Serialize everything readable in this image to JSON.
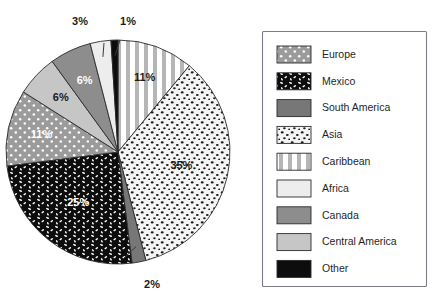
{
  "chart_data": {
    "type": "pie",
    "title": "",
    "subtitle": "",
    "xlabel": "",
    "ylabel": "",
    "legend_position": "right",
    "grid": false,
    "categories": [
      "Caribbean",
      "Asia",
      "South America",
      "Mexico",
      "Europe",
      "Central America",
      "Canada",
      "Africa",
      "Other"
    ],
    "values": [
      11,
      35,
      2,
      25,
      11,
      6,
      6,
      3,
      1
    ],
    "value_labels": [
      "11%",
      "35%",
      "2%",
      "25%",
      "11%",
      "6%",
      "6%",
      "3%",
      "1%"
    ],
    "slices": [
      {
        "name": "Caribbean",
        "value": 11,
        "label": "11%",
        "fill": "#ffffff",
        "pattern": "vertical-stripes",
        "label_placement": "inside",
        "label_fill": "#1b1b1b"
      },
      {
        "name": "Asia",
        "value": 35,
        "label": "35%",
        "fill": "#f2f2f2",
        "pattern": "black-speckles",
        "label_placement": "inside",
        "label_fill": "#1b1b1b"
      },
      {
        "name": "South America",
        "value": 2,
        "label": "2%",
        "fill": "#777777",
        "pattern": "solid",
        "label_placement": "callout",
        "label_fill": "#1b1b1b"
      },
      {
        "name": "Mexico",
        "value": 25,
        "label": "25%",
        "fill": "#0d0d0d",
        "pattern": "white-dashes",
        "label_placement": "inside",
        "label_fill": "#ffffff"
      },
      {
        "name": "Europe",
        "value": 11,
        "label": "11%",
        "fill": "#9b9b9b",
        "pattern": "white-dots",
        "label_placement": "inside",
        "label_fill": "#ffffff"
      },
      {
        "name": "Central America",
        "value": 6,
        "label": "6%",
        "fill": "#c6c6c6",
        "pattern": "solid",
        "label_placement": "inside",
        "label_fill": "#1b1b1b"
      },
      {
        "name": "Canada",
        "value": 6,
        "label": "6%",
        "fill": "#8d8d8d",
        "pattern": "solid",
        "label_placement": "inside",
        "label_fill": "#ffffff"
      },
      {
        "name": "Africa",
        "value": 3,
        "label": "3%",
        "fill": "#ededed",
        "pattern": "solid",
        "label_placement": "callout",
        "label_fill": "#1b1b1b"
      },
      {
        "name": "Other",
        "value": 1,
        "label": "1%",
        "fill": "#0d0d0d",
        "pattern": "solid",
        "label_placement": "callout",
        "label_fill": "#1b1b1b"
      }
    ]
  },
  "legend": {
    "items": [
      {
        "label": "Europe",
        "fill": "#9b9b9b",
        "pattern": "white-dots"
      },
      {
        "label": "Mexico",
        "fill": "#0d0d0d",
        "pattern": "white-dashes"
      },
      {
        "label": "South America",
        "fill": "#777777",
        "pattern": "solid"
      },
      {
        "label": "Asia",
        "fill": "#f2f2f2",
        "pattern": "black-speckles"
      },
      {
        "label": "Caribbean",
        "fill": "#ffffff",
        "pattern": "vertical-stripes"
      },
      {
        "label": "Africa",
        "fill": "#ededed",
        "pattern": "solid"
      },
      {
        "label": "Canada",
        "fill": "#8d8d8d",
        "pattern": "solid"
      },
      {
        "label": "Central America",
        "fill": "#c6c6c6",
        "pattern": "solid"
      },
      {
        "label": "Other",
        "fill": "#0d0d0d",
        "pattern": "solid"
      }
    ]
  },
  "colors": {
    "background": "#ffffff",
    "outline": "#2b2b2b",
    "legend_border": "#7c7c86",
    "text": "#1f1f1f"
  }
}
